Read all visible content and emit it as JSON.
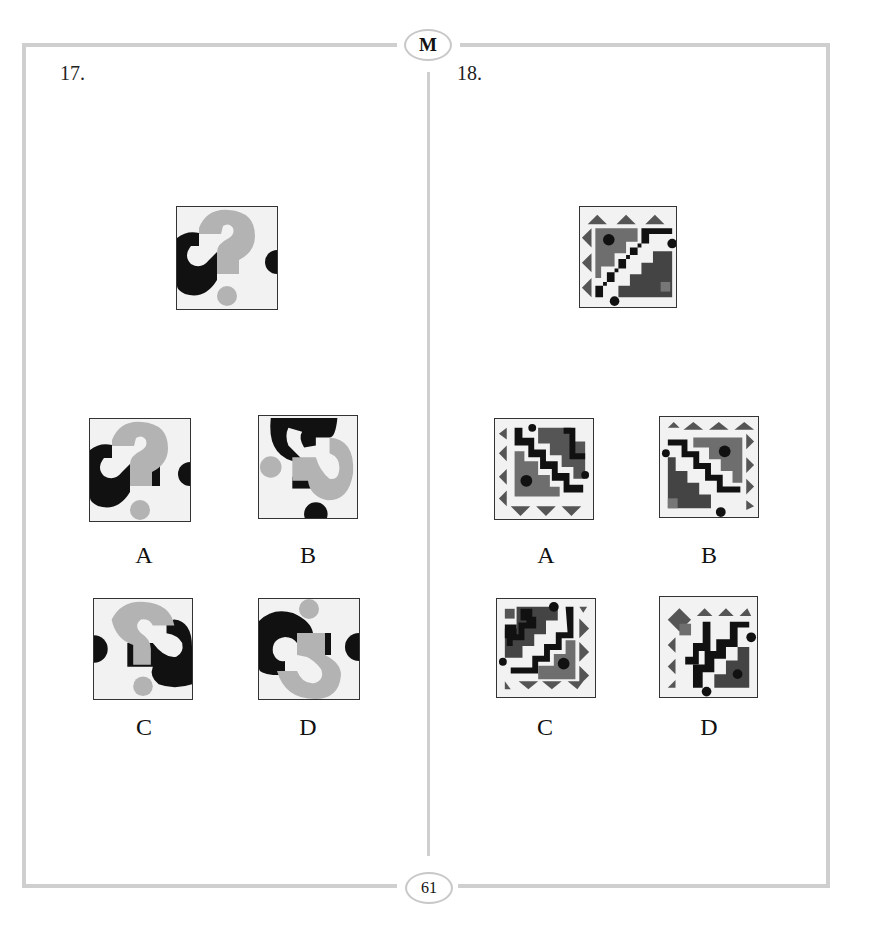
{
  "page": {
    "header_badge": "M",
    "page_number": "61"
  },
  "questions": [
    {
      "number": "17.",
      "stem_figure": "question-mark-tile",
      "options": [
        {
          "label": "A",
          "figure": "question-mark-tile-variant-a"
        },
        {
          "label": "B",
          "figure": "question-mark-tile-variant-b"
        },
        {
          "label": "C",
          "figure": "question-mark-tile-variant-c"
        },
        {
          "label": "D",
          "figure": "question-mark-tile-variant-d"
        }
      ]
    },
    {
      "number": "18.",
      "stem_figure": "staircase-triangle-tile",
      "options": [
        {
          "label": "A",
          "figure": "staircase-tile-variant-a"
        },
        {
          "label": "B",
          "figure": "staircase-tile-variant-b"
        },
        {
          "label": "C",
          "figure": "staircase-tile-variant-c"
        },
        {
          "label": "D",
          "figure": "staircase-tile-variant-d"
        }
      ]
    }
  ],
  "colors": {
    "frame": "#cfcfcf",
    "black": "#111111",
    "light_gray": "#b3b3b3",
    "mid_gray": "#6e6e6e",
    "dark_gray": "#444444",
    "tile_bg": "#f2f2f2"
  }
}
